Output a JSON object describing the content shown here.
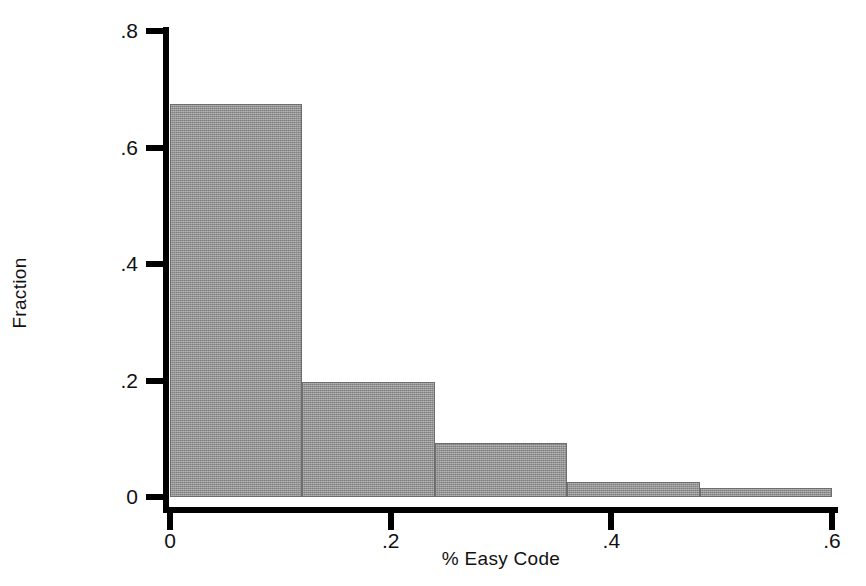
{
  "chart_data": {
    "type": "bar",
    "title": "",
    "xlabel": "% Easy Code",
    "ylabel": "Fraction",
    "xlim": [
      0,
      0.6
    ],
    "ylim": [
      0,
      0.8
    ],
    "grid": false,
    "legend": "none",
    "bin_width": 0.12,
    "bin_edges": [
      0,
      0.12,
      0.24,
      0.36,
      0.48,
      0.6
    ],
    "categories": [
      "0–0.12",
      "0.12–0.24",
      "0.24–0.36",
      "0.36–0.48",
      "0.48–0.60"
    ],
    "values": [
      0.675,
      0.198,
      0.093,
      0.026,
      0.015
    ],
    "xticks": [
      {
        "value": 0,
        "label": "0"
      },
      {
        "value": 0.2,
        "label": ".2"
      },
      {
        "value": 0.4,
        "label": ".4"
      },
      {
        "value": 0.6,
        "label": ".6"
      }
    ],
    "yticks": [
      {
        "value": 0,
        "label": "0"
      },
      {
        "value": 0.2,
        "label": ".2"
      },
      {
        "value": 0.4,
        "label": ".4"
      },
      {
        "value": 0.6,
        "label": ".6"
      },
      {
        "value": 0.8,
        "label": ".8"
      }
    ],
    "colors": {
      "bar_fill": "#9a9a9a",
      "bar_edge": "#6e6e6e",
      "axis": "#000000",
      "background": "#ffffff",
      "text": "#111111"
    }
  }
}
